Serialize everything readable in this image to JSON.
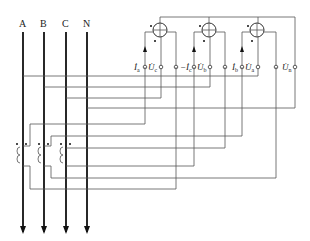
{
  "diagram": {
    "type": "three-phase four-wire energy meter wiring with current transformers",
    "phase_labels": [
      "A",
      "B",
      "C",
      "N"
    ],
    "meters": [
      {
        "id": "meter-1",
        "current_label": "İa",
        "voltage_label": "U̇c"
      },
      {
        "id": "meter-2",
        "current_label": "−İc",
        "voltage_label": "U̇b"
      },
      {
        "id": "meter-3",
        "current_label": "İb",
        "voltage_label": "U̇a"
      }
    ],
    "neutral_terminal_label": "U̇n",
    "terminal_labels": {
      "ia": {
        "main": "İ",
        "sub": "a"
      },
      "uc": {
        "main": "U̇",
        "sub": "c"
      },
      "mic": {
        "main": "−İ",
        "sub": "c"
      },
      "ub": {
        "main": "U̇",
        "sub": "b"
      },
      "ib": {
        "main": "İ",
        "sub": "b"
      },
      "ua": {
        "main": "U̇",
        "sub": "a"
      },
      "un": {
        "main": "U̇",
        "sub": "n"
      }
    },
    "current_transformers": [
      "CT-A",
      "CT-B",
      "CT-C"
    ]
  }
}
